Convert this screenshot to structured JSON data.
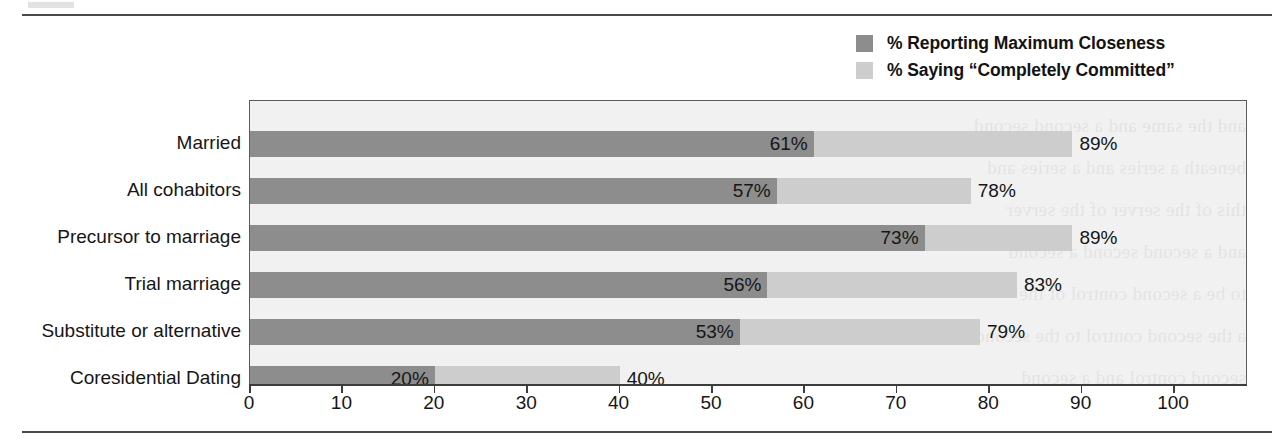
{
  "figure": {
    "background_color": "#ffffff",
    "rule_color": "#4a4a4a",
    "plot_background": "#f1f1f1",
    "plot_border_color": "#5b5b5b"
  },
  "legend": {
    "position": "top-right",
    "entries": [
      {
        "label": "% Reporting Maximum Closeness",
        "color": "#8d8d8d",
        "swatch_name": "legend-swatch-closeness"
      },
      {
        "label": "% Saying “Completely Committed”",
        "color": "#cdcdcd",
        "swatch_name": "legend-swatch-committed"
      }
    ]
  },
  "bleed_text": [
    "and the same and a second second",
    "beneath a series and a series and",
    "this of the server of the server",
    "and a second second a second",
    "to be a second control of the",
    "a the second control to the second",
    "second control and a second"
  ],
  "chart_data": {
    "type": "bar",
    "orientation": "horizontal",
    "stacked_overlay": true,
    "title": "",
    "xlabel": "",
    "ylabel": "",
    "xlim": [
      0,
      108
    ],
    "xticks": [
      0,
      10,
      20,
      30,
      40,
      50,
      60,
      70,
      80,
      90,
      100
    ],
    "xtick_labels": [
      "0",
      "10",
      "20",
      "30",
      "40",
      "50",
      "60",
      "70",
      "80",
      "90",
      "100"
    ],
    "grid": false,
    "legend_position": "top-right",
    "categories": [
      "Married",
      "All cohabitors",
      "Precursor to marriage",
      "Trial marriage",
      "Substitute or alternative",
      "Coresidential Dating"
    ],
    "series": [
      {
        "name": "% Reporting Maximum Closeness",
        "color": "#8d8d8d",
        "values": [
          61,
          57,
          73,
          56,
          53,
          20
        ],
        "labels": [
          "61%",
          "57%",
          "73%",
          "56%",
          "53%",
          "20%"
        ]
      },
      {
        "name": "% Saying “Completely Committed”",
        "color": "#cdcdcd",
        "values": [
          89,
          78,
          89,
          83,
          79,
          40
        ],
        "labels": [
          "89%",
          "78%",
          "89%",
          "83%",
          "79%",
          "40%"
        ]
      }
    ]
  }
}
